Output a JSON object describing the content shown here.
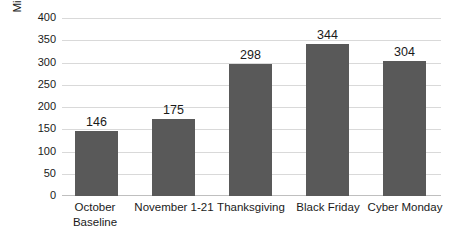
{
  "chart_data": {
    "type": "bar",
    "title": "",
    "subtitle": "",
    "xlabel": "",
    "ylabel": "Millions",
    "categories": [
      "October Baseline",
      "November 1-21",
      "Thanksgiving",
      "Black Friday",
      "Cyber Monday"
    ],
    "category_lines": [
      [
        "October",
        "Baseline"
      ],
      [
        "November 1-21"
      ],
      [
        "Thanksgiving"
      ],
      [
        "Black Friday"
      ],
      [
        "Cyber Monday"
      ]
    ],
    "values": [
      146,
      175,
      298,
      344,
      304
    ],
    "data_labels": [
      "146",
      "175",
      "298",
      "344",
      "304"
    ],
    "ylim": [
      0,
      400
    ],
    "ytick_labels": [
      "400",
      "350",
      "300",
      "250",
      "200",
      "150",
      "100",
      "50",
      "0"
    ],
    "ytick_values": [
      400,
      350,
      300,
      250,
      200,
      150,
      100,
      50,
      0
    ],
    "grid": true,
    "legend": false,
    "legend_position": "none",
    "series": [
      {
        "name": "Transactions",
        "values": [
          146,
          175,
          298,
          344,
          304
        ]
      }
    ]
  },
  "style": {
    "bar_color": "#595959",
    "gridline_color": "#d9d9d9",
    "axis_color": "#bfbfbf",
    "text_color": "#1a1a1a",
    "background_color": "#ffffff"
  }
}
